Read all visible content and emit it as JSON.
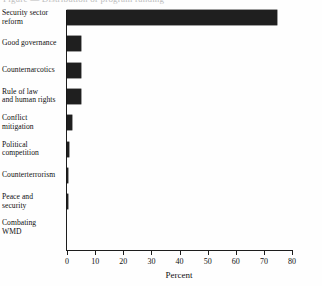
{
  "figure": {
    "caption_remnant": "Figure — Distribution of program funding",
    "background_color": "#ffffff",
    "bar_color": "#1f1f1f",
    "axis_color": "#1d1d1d"
  },
  "chart_data": {
    "type": "bar",
    "orientation": "horizontal",
    "title": "",
    "xlabel": "Percent",
    "ylabel": "",
    "xlim": [
      0,
      80
    ],
    "xticks": [
      0,
      10,
      20,
      30,
      40,
      50,
      60,
      70,
      80
    ],
    "xtick_labels": [
      "0",
      "10",
      "20",
      "30",
      "40",
      "50",
      "60",
      "70",
      "80"
    ],
    "grid": false,
    "legend": false,
    "categories": [
      "Security sector reform",
      "Good governance",
      "Counternarcotics",
      "Rule of law and human rights",
      "Conflict mitigation",
      "Political competition",
      "Counterterrorism",
      "Peace and security",
      "Combating WMD"
    ],
    "category_lines": [
      [
        "Security sector",
        "reform"
      ],
      [
        "Good governance"
      ],
      [
        "Counternarcotics"
      ],
      [
        "Rule of law",
        "and human rights"
      ],
      [
        "Conflict",
        "mitigation"
      ],
      [
        "Political",
        "competition"
      ],
      [
        "Counterterrorism"
      ],
      [
        "Peace and",
        "security"
      ],
      [
        "Combating",
        "WMD"
      ]
    ],
    "values": [
      74.5,
      5.1,
      5.1,
      5.0,
      1.6,
      0.6,
      0.4,
      0.3,
      0.2
    ],
    "units": "percent"
  }
}
